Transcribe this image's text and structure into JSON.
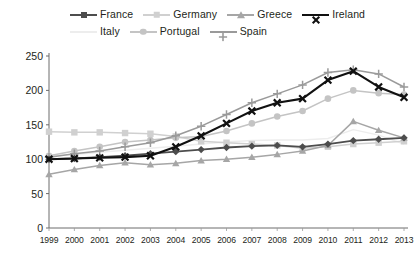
{
  "chart_data": {
    "type": "line",
    "title": "",
    "subtitle": "",
    "xlabel": "",
    "ylabel": "",
    "x": [
      1999,
      2000,
      2001,
      2002,
      2003,
      2004,
      2005,
      2006,
      2007,
      2008,
      2009,
      2010,
      2011,
      2012,
      2013
    ],
    "categories": [
      "1999",
      "2000",
      "2001",
      "2002",
      "2003",
      "2004",
      "2005",
      "2006",
      "2007",
      "2008",
      "2009",
      "2010",
      "2011",
      "2012",
      "2013"
    ],
    "xlim": [
      1999,
      2013
    ],
    "ylim": [
      0,
      250
    ],
    "yticks": [
      0,
      50,
      100,
      150,
      200,
      250
    ],
    "ytick_labels": [
      "0",
      "50",
      "100",
      "150",
      "200",
      "250"
    ],
    "grid": false,
    "legend_position": "top",
    "series": [
      {
        "name": "France",
        "color": "#4d4d4d",
        "marker": "diamond",
        "values": [
          100,
          101,
          103,
          105,
          108,
          111,
          114,
          117,
          119,
          120,
          118,
          122,
          127,
          129,
          131
        ]
      },
      {
        "name": "Germany",
        "color": "#d0d0d0",
        "marker": "square",
        "values": [
          140,
          139,
          139,
          138,
          137,
          133,
          126,
          124,
          122,
          120,
          116,
          118,
          122,
          124,
          126
        ]
      },
      {
        "name": "Greece",
        "color": "#a6a6a6",
        "marker": "triangle",
        "values": [
          78,
          85,
          91,
          95,
          92,
          94,
          98,
          100,
          103,
          107,
          112,
          120,
          155,
          142,
          131
        ]
      },
      {
        "name": "Ireland",
        "color": "#111111",
        "marker": "x",
        "values": [
          100,
          101,
          102,
          103,
          105,
          118,
          134,
          152,
          170,
          182,
          188,
          215,
          228,
          205,
          190
        ]
      },
      {
        "name": "Italy",
        "color": "#ededed",
        "marker": "none",
        "values": [
          105,
          107,
          110,
          113,
          116,
          119,
          122,
          125,
          127,
          128,
          128,
          130,
          143,
          135,
          122
        ]
      },
      {
        "name": "Portugal",
        "color": "#c4c4c4",
        "marker": "circle",
        "values": [
          105,
          112,
          118,
          125,
          128,
          131,
          133,
          141,
          152,
          162,
          170,
          188,
          200,
          196,
          194
        ]
      },
      {
        "name": "Spain",
        "color": "#9a9a9a",
        "marker": "plus",
        "values": [
          103,
          108,
          112,
          118,
          124,
          134,
          148,
          165,
          182,
          195,
          208,
          226,
          230,
          224,
          205
        ]
      }
    ]
  },
  "legend": {
    "items": [
      {
        "label": "France"
      },
      {
        "label": "Germany"
      },
      {
        "label": "Greece"
      },
      {
        "label": "Ireland"
      },
      {
        "label": "Italy"
      },
      {
        "label": "Portugal"
      },
      {
        "label": "Spain"
      }
    ]
  },
  "axes": {
    "y_labels": [
      "250",
      "200",
      "150",
      "100",
      "50",
      "0"
    ],
    "x_labels": [
      "1999",
      "2000",
      "2001",
      "2002",
      "2003",
      "2004",
      "2005",
      "2006",
      "2007",
      "2008",
      "2009",
      "2010",
      "2011",
      "2012",
      "2013"
    ]
  },
  "icons": {
    "marker_diamond": "diamond-marker-icon",
    "marker_square": "square-marker-icon",
    "marker_triangle": "triangle-marker-icon",
    "marker_x": "x-marker-icon",
    "marker_circle": "circle-marker-icon",
    "marker_plus": "plus-marker-icon"
  }
}
